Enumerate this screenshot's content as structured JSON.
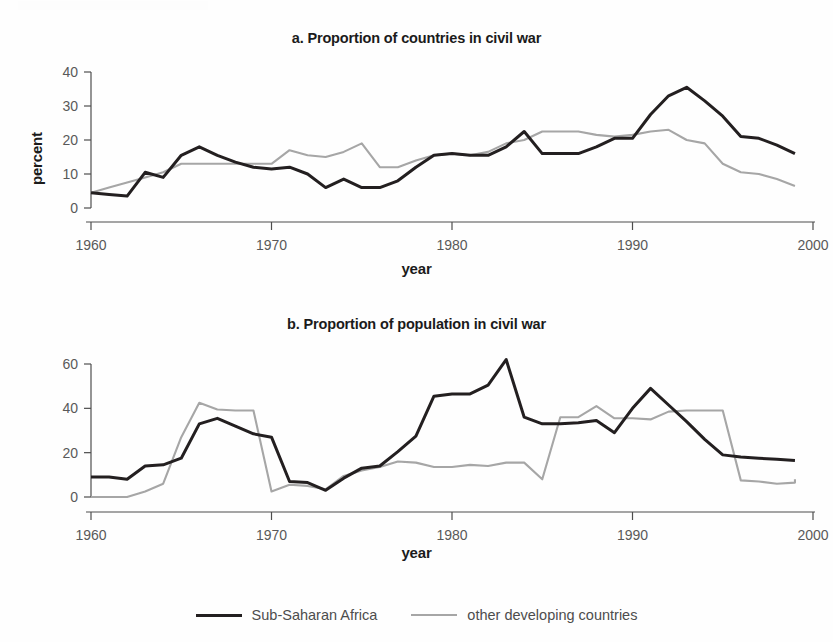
{
  "figure": {
    "legend": {
      "items": [
        {
          "label": "Sub-Saharan Africa",
          "color": "#231f20",
          "style": "dark"
        },
        {
          "label": "other developing countries",
          "color": "#a6a6a6",
          "style": "light"
        }
      ]
    }
  },
  "panels": {
    "a": {
      "title": "a. Proportion of countries in civil war",
      "xlabel": "year",
      "ylabel": "percent",
      "yticks": [
        "0",
        "10",
        "20",
        "30",
        "40"
      ],
      "xticks": [
        "1960",
        "1970",
        "1980",
        "1990",
        "2000"
      ]
    },
    "b": {
      "title": "b. Proportion of population in civil war",
      "xlabel": "year",
      "ylabel": "percent",
      "yticks": [
        "0",
        "20",
        "40",
        "60"
      ],
      "xticks": [
        "1960",
        "1970",
        "1980",
        "1990",
        "2000"
      ]
    }
  },
  "chart_data": [
    {
      "id": "a",
      "type": "line",
      "title": "a. Proportion of countries in civil war",
      "xlabel": "year",
      "ylabel": "percent",
      "xlim": [
        1960,
        2000
      ],
      "ylim": [
        0,
        43
      ],
      "ytick_values": [
        0,
        10,
        20,
        30,
        40
      ],
      "xtick_values": [
        1960,
        1970,
        1980,
        1990,
        2000
      ],
      "grid": false,
      "legend_position": "bottom-center-shared",
      "x": [
        1960,
        1961,
        1962,
        1963,
        1964,
        1965,
        1966,
        1967,
        1968,
        1969,
        1970,
        1971,
        1972,
        1973,
        1974,
        1975,
        1976,
        1977,
        1978,
        1979,
        1980,
        1981,
        1982,
        1983,
        1984,
        1985,
        1986,
        1987,
        1988,
        1989,
        1990,
        1991,
        1992,
        1993,
        1994,
        1995,
        1996,
        1997,
        1998,
        1999
      ],
      "series": [
        {
          "name": "Sub-Saharan Africa",
          "color": "#231f20",
          "values": [
            4.5,
            4.0,
            3.5,
            10.5,
            9.0,
            15.5,
            18.0,
            15.5,
            13.5,
            12.0,
            11.5,
            12.0,
            10.0,
            6.0,
            8.5,
            6.0,
            6.0,
            8.0,
            12.0,
            15.5,
            16.0,
            15.5,
            15.5,
            18.0,
            22.5,
            16.0,
            16.0,
            16.0,
            18.0,
            20.5,
            20.5,
            27.5,
            33.0,
            35.5,
            31.5,
            27.0,
            21.0,
            20.5,
            18.5,
            16.0,
            16.0
          ]
        },
        {
          "name": "other developing countries",
          "color": "#a6a6a6",
          "values": [
            4.5,
            6.0,
            7.5,
            9.0,
            10.5,
            13.0,
            13.0,
            13.0,
            13.0,
            13.0,
            13.0,
            17.0,
            15.5,
            15.0,
            16.5,
            19.0,
            12.0,
            12.0,
            14.0,
            15.5,
            16.0,
            15.5,
            16.5,
            19.0,
            20.0,
            22.5,
            22.5,
            22.5,
            21.5,
            21.0,
            21.5,
            22.5,
            23.0,
            20.0,
            19.0,
            13.0,
            10.5,
            10.0,
            8.5,
            6.5
          ]
        }
      ]
    },
    {
      "id": "b",
      "type": "line",
      "title": "b. Proportion of population in civil war",
      "xlabel": "year",
      "ylabel": "percent",
      "xlim": [
        1960,
        2000
      ],
      "ylim": [
        -1,
        68
      ],
      "ytick_values": [
        0,
        20,
        40,
        60
      ],
      "xtick_values": [
        1960,
        1970,
        1980,
        1990,
        2000
      ],
      "grid": false,
      "legend_position": "bottom-center-shared",
      "x": [
        1960,
        1961,
        1962,
        1963,
        1964,
        1965,
        1966,
        1967,
        1968,
        1969,
        1970,
        1971,
        1972,
        1973,
        1974,
        1975,
        1976,
        1977,
        1978,
        1979,
        1980,
        1981,
        1982,
        1983,
        1984,
        1985,
        1986,
        1987,
        1988,
        1989,
        1990,
        1991,
        1992,
        1993,
        1994,
        1995,
        1996,
        1997,
        1998,
        1999
      ],
      "series": [
        {
          "name": "Sub-Saharan Africa",
          "color": "#231f20",
          "values": [
            9.0,
            9.0,
            8.0,
            14.0,
            14.5,
            17.5,
            33.0,
            35.5,
            32.0,
            28.5,
            27.0,
            7.0,
            6.5,
            3.0,
            8.5,
            13.0,
            14.0,
            20.5,
            27.5,
            45.5,
            46.5,
            46.5,
            50.5,
            62.0,
            36.0,
            33.0,
            33.0,
            33.5,
            34.5,
            29.0,
            40.0,
            49.0,
            41.5,
            34.0,
            26.0,
            19.0,
            18.0,
            17.5,
            17.0,
            16.5
          ]
        },
        {
          "name": "other developing countries",
          "color": "#a6a6a6",
          "values": [
            0.0,
            0.0,
            0.0,
            2.5,
            6.0,
            27.0,
            42.5,
            39.5,
            39.0,
            39.0,
            2.5,
            5.5,
            5.0,
            3.5,
            9.5,
            12.0,
            13.5,
            16.0,
            15.5,
            13.5,
            13.5,
            14.5,
            14.0,
            15.5,
            15.5,
            8.0,
            36.0,
            36.0,
            41.0,
            35.5,
            35.5,
            35.0,
            38.5,
            39.0,
            39.0,
            39.0,
            7.5,
            7.0,
            6.0,
            6.5,
            8.0
          ]
        }
      ]
    }
  ]
}
